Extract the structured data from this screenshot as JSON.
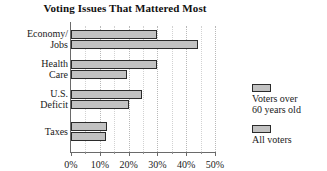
{
  "chart_data": {
    "type": "bar",
    "orientation": "horizontal",
    "title": "Voting Issues That Mattered Most",
    "xlabel": "",
    "ylabel": "",
    "xlim": [
      0,
      50
    ],
    "xticks": [
      0,
      10,
      20,
      30,
      40,
      50
    ],
    "xtick_labels": [
      "0%",
      "10%",
      "20%",
      "30%",
      "40%",
      "50%"
    ],
    "minor_tick_interval": 5,
    "grid": true,
    "grid_axis": "x",
    "legend_position": "right",
    "categories": [
      {
        "line1": "Economy/",
        "line2": "Jobs"
      },
      {
        "line1": "Health",
        "line2": "Care"
      },
      {
        "line1": "U.S.",
        "line2": "Deficit"
      },
      {
        "line1": "Taxes",
        "line2": ""
      }
    ],
    "category_labels": [
      "Economy/ Jobs",
      "Health Care",
      "U.S. Deficit",
      "Taxes"
    ],
    "series": [
      {
        "name": "Voters over 60 years old",
        "legend_line1": "Voters over",
        "legend_line2": "60 years old",
        "color": "#c2c2c2",
        "border_color": "#2b2b2b",
        "values": [
          30,
          30,
          24.5,
          12.5
        ]
      },
      {
        "name": "All voters",
        "legend_line1": "All voters",
        "legend_line2": "",
        "color": "#c2c2c2",
        "border_color": "#2b2b2b",
        "values": [
          44,
          19.5,
          20,
          12
        ]
      }
    ]
  },
  "style": {
    "background": "#ffffff",
    "axis_color": "#6a6a6a",
    "grid_color": "#b9b9b9",
    "text_color": "#1a1a1a"
  }
}
